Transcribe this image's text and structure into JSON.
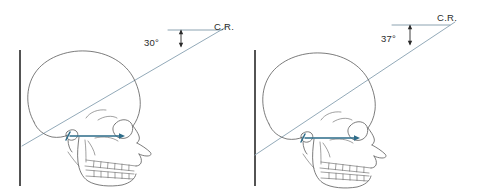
{
  "figure": {
    "background_color": "#ffffff",
    "width": 479,
    "height": 191
  },
  "colors": {
    "skull_outline": "#5b5b5b",
    "skull_detail": "#6e6e6e",
    "image_receptor_line": "#1a1a1a",
    "central_ray": "#93aab9",
    "reference_line": "#7f99a8",
    "orbitomeatal_line": "#2d6c89",
    "text": "#2b2b2b"
  },
  "panels": [
    {
      "id": "left-panel",
      "name": "thirty-degree-panel",
      "angle_label": "30°",
      "angle_value": 30,
      "cr_label": "C.R.",
      "receptor_label": "",
      "elements": {
        "vertical_receptor_line": "image-receptor",
        "central_ray": "central-ray",
        "horizontal_reference": "horizontal-reference-line",
        "angle_indicator": "angle-double-arrow",
        "orbitomeatal_line": "orbitomeatal-line-arrow"
      }
    },
    {
      "id": "right-panel",
      "name": "thirty-seven-degree-panel",
      "angle_label": "37°",
      "angle_value": 37,
      "cr_label": "C.R.",
      "receptor_label": "",
      "elements": {
        "vertical_receptor_line": "image-receptor",
        "central_ray": "central-ray",
        "horizontal_reference": "horizontal-reference-line",
        "angle_indicator": "angle-double-arrow",
        "orbitomeatal_line": "orbitomeatal-line-arrow"
      }
    }
  ]
}
